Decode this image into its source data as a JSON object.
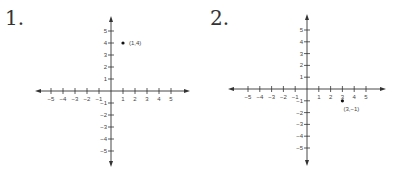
{
  "problems": [
    {
      "number_label": "1.",
      "point_label": "(1,4)"
    },
    {
      "number_label": "2.",
      "point_label": "(3,−1)"
    }
  ],
  "chart_data": [
    {
      "type": "scatter",
      "title": "1.",
      "xlim": [
        -6,
        6
      ],
      "ylim": [
        -6,
        6
      ],
      "x_ticks": [
        -5,
        -4,
        -3,
        -2,
        -1,
        1,
        2,
        3,
        4,
        5
      ],
      "y_ticks": [
        -5,
        -4,
        -3,
        -2,
        -1,
        1,
        2,
        3,
        4,
        5
      ],
      "grid": false,
      "points": [
        {
          "x": 1,
          "y": 4,
          "label": "(1,4)"
        }
      ]
    },
    {
      "type": "scatter",
      "title": "2.",
      "xlim": [
        -6,
        6
      ],
      "ylim": [
        -6,
        6
      ],
      "x_ticks": [
        -5,
        -4,
        -3,
        -2,
        -1,
        1,
        2,
        3,
        4,
        5
      ],
      "y_ticks": [
        -5,
        -4,
        -3,
        -2,
        -1,
        1,
        2,
        3,
        4,
        5
      ],
      "grid": false,
      "points": [
        {
          "x": 3,
          "y": -1,
          "label": "(3,−1)"
        }
      ]
    }
  ]
}
